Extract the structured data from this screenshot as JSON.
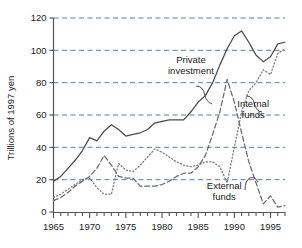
{
  "chart_data": {
    "type": "line",
    "title": "",
    "xlabel": "",
    "ylabel": "Trillions of 1997 yen",
    "xlim": [
      1965,
      1997
    ],
    "ylim": [
      0,
      120
    ],
    "grid": true,
    "legend_position": "inline-annotations",
    "y_ticks": [
      0,
      20,
      40,
      60,
      80,
      100,
      120
    ],
    "y_tick_labels": [
      "0",
      "20",
      "40",
      "60",
      "80",
      "100",
      "120"
    ],
    "x_ticks": [
      1965,
      1970,
      1975,
      1980,
      1985,
      1990,
      1995
    ],
    "x_tick_labels": [
      "1965",
      "1970",
      "1975",
      "1980",
      "1985",
      "1990",
      "1995"
    ],
    "x_minor_tick_step": 1,
    "annotations": [
      {
        "name": "private-investment",
        "text_line1": "Private",
        "text_line2": "investment",
        "x": 1984.0,
        "y": 92.0
      },
      {
        "name": "internal-funds",
        "text_line1": "Internal",
        "text_line2": "funds",
        "x": 1992.6,
        "y": 65.0
      },
      {
        "name": "external-funds",
        "text_line1": "External",
        "text_line2": "funds",
        "x": 1988.6,
        "y": 14.0
      }
    ],
    "series": [
      {
        "name": "Private investment",
        "style": "solid",
        "color": "#4a4a4a",
        "x": [
          1965,
          1966,
          1967,
          1968,
          1969,
          1970,
          1971,
          1972,
          1973,
          1974,
          1975,
          1976,
          1977,
          1978,
          1979,
          1980,
          1981,
          1982,
          1983,
          1984,
          1985,
          1986,
          1987,
          1988,
          1989,
          1990,
          1991,
          1992,
          1993,
          1994,
          1995,
          1996,
          1997
        ],
        "values": [
          19,
          22,
          27,
          32,
          38,
          46,
          44,
          50,
          54,
          51,
          47,
          48,
          49,
          51,
          55,
          56,
          57,
          57,
          57,
          62,
          68,
          72,
          80,
          91,
          101,
          109,
          112,
          105,
          97,
          93,
          96,
          104,
          105
        ]
      },
      {
        "name": "Internal funds",
        "style": "dotted",
        "color": "#7a7a7a",
        "x": [
          1965,
          1966,
          1967,
          1968,
          1969,
          1970,
          1971,
          1972,
          1973,
          1974,
          1975,
          1976,
          1977,
          1978,
          1979,
          1980,
          1981,
          1982,
          1983,
          1984,
          1985,
          1986,
          1987,
          1988,
          1989,
          1990,
          1991,
          1992,
          1993,
          1994,
          1995,
          1996,
          1997
        ],
        "values": [
          9,
          11,
          14,
          17,
          20,
          21,
          15,
          11,
          11,
          30,
          26,
          25,
          29,
          34,
          39,
          37,
          34,
          31,
          29,
          28,
          29,
          31,
          31,
          28,
          18,
          40,
          62,
          75,
          80,
          88,
          85,
          98,
          101
        ]
      },
      {
        "name": "External funds",
        "style": "dashed",
        "color": "#6a6a6a",
        "x": [
          1965,
          1966,
          1967,
          1968,
          1969,
          1970,
          1971,
          1972,
          1973,
          1974,
          1975,
          1976,
          1977,
          1978,
          1979,
          1980,
          1981,
          1982,
          1983,
          1984,
          1985,
          1986,
          1987,
          1988,
          1989,
          1990,
          1991,
          1992,
          1993,
          1994,
          1995,
          1996,
          1997
        ],
        "values": [
          7,
          9,
          12,
          16,
          19,
          22,
          27,
          35,
          29,
          22,
          21,
          21,
          16,
          16,
          16,
          17,
          19,
          22,
          24,
          24,
          28,
          35,
          48,
          62,
          82,
          68,
          49,
          31,
          18,
          5,
          10,
          3,
          4
        ]
      }
    ]
  },
  "figure": {
    "background_color": "#ffffff",
    "grid_color": "#5d7fa0",
    "axis_color": "#555555"
  }
}
